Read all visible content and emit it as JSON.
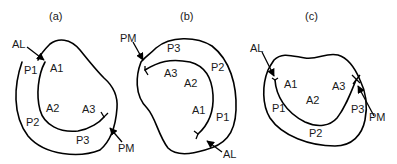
{
  "panels": [
    {
      "title": "(a)",
      "labels": {
        "AL": "AL",
        "PM": "PM",
        "A1": "A1",
        "A2": "A2",
        "A3": "A3",
        "P1": "P1",
        "P2": "P2",
        "P3": "P3"
      }
    },
    {
      "title": "(b)",
      "labels": {
        "AL": "AL",
        "PM": "PM",
        "A1": "A1",
        "A2": "A2",
        "A3": "A3",
        "P1": "P1",
        "P2": "P2",
        "P3": "P3"
      }
    },
    {
      "title": "(c)",
      "labels": {
        "AL": "AL",
        "PM": "PM",
        "A1": "A1",
        "A2": "A2",
        "A3": "A3",
        "P1": "P1",
        "P2": "P2",
        "P3": "P3"
      }
    }
  ]
}
